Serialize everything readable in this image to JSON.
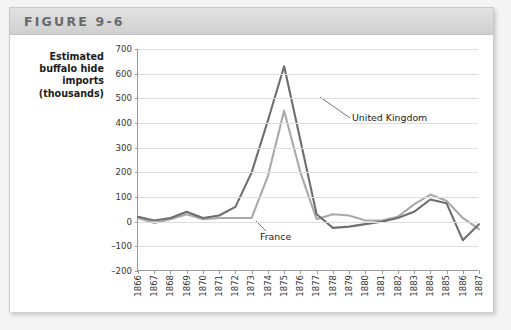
{
  "figure": {
    "title": "FIGURE 9-6"
  },
  "chart_data": {
    "type": "line",
    "title": "FIGURE 9-6",
    "ylabel": "Estimated buffalo hide imports (thousands)",
    "ylabel_lines": [
      "Estimated",
      "buffalo hide",
      "imports",
      "(thousands)"
    ],
    "xlabel": "",
    "xlim": [
      1866,
      1887
    ],
    "ylim": [
      -200,
      700
    ],
    "yticks": [
      700,
      600,
      500,
      400,
      300,
      200,
      100,
      0,
      -100,
      -200
    ],
    "grid": true,
    "legend_position": "inline-annotation",
    "categories": [
      1866,
      1867,
      1868,
      1869,
      1870,
      1871,
      1872,
      1873,
      1874,
      1875,
      1876,
      1877,
      1878,
      1879,
      1880,
      1881,
      1882,
      1883,
      1884,
      1885,
      1886,
      1887
    ],
    "series": [
      {
        "name": "United Kingdom",
        "color": "#6e6e6e",
        "values": [
          20,
          5,
          15,
          40,
          15,
          25,
          60,
          200,
          410,
          630,
          330,
          30,
          -25,
          -20,
          -10,
          0,
          15,
          40,
          90,
          75,
          -75,
          -10
        ]
      },
      {
        "name": "France",
        "color": "#a9a9a9",
        "values": [
          15,
          -5,
          10,
          30,
          10,
          15,
          15,
          15,
          185,
          450,
          200,
          10,
          30,
          25,
          5,
          5,
          20,
          70,
          110,
          85,
          15,
          -30
        ]
      }
    ],
    "annotations": [
      {
        "text": "United Kingdom",
        "series": "United Kingdom"
      },
      {
        "text": "France",
        "series": "France"
      }
    ]
  }
}
